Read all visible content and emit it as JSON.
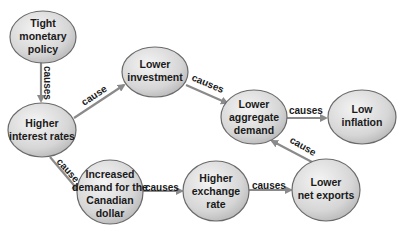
{
  "nodes": {
    "tight_monetary_policy": {
      "lines": [
        "Tight",
        "monetary",
        "policy"
      ]
    },
    "higher_interest_rates": {
      "lines": [
        "Higher",
        "interest rates"
      ]
    },
    "lower_investment": {
      "lines": [
        "Lower",
        "investment"
      ]
    },
    "lower_aggregate_demand": {
      "lines": [
        "Lower",
        "aggregate",
        "demand"
      ]
    },
    "low_inflation": {
      "lines": [
        "Low",
        "inflation"
      ]
    },
    "increased_demand_cad": {
      "lines": [
        "Increased",
        "demand for the",
        "Canadian",
        "dollar"
      ]
    },
    "higher_exchange_rate": {
      "lines": [
        "Higher",
        "exchange",
        "rate"
      ]
    },
    "lower_net_exports": {
      "lines": [
        "Lower",
        "net exports"
      ]
    }
  },
  "edges": {
    "policy_to_rates": {
      "label": "causes"
    },
    "rates_to_investment": {
      "label": "cause"
    },
    "investment_to_ad": {
      "label": "causes"
    },
    "ad_to_inflation": {
      "label": "causes"
    },
    "rates_to_cad_demand": {
      "label": "cause"
    },
    "cad_demand_to_exchange": {
      "label": "causes"
    },
    "exchange_to_exports": {
      "label": "causes"
    },
    "exports_to_ad": {
      "label": "cause"
    }
  },
  "colors": {
    "node_fill_light": "#f2f2f2",
    "node_fill_dark": "#bdbdbd",
    "node_stroke": "#6a6a6a",
    "arrow": "#8a8a8a",
    "text": "#1a1a1a"
  }
}
